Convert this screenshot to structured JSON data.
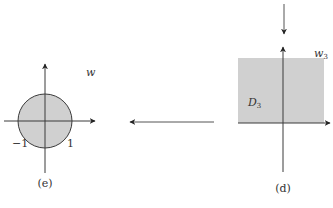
{
  "panels": {
    "e": {
      "caption": "(e)",
      "plane_label": "w",
      "tick_neg": "−1",
      "tick_pos": "1",
      "region": "unit disk"
    },
    "d": {
      "caption": "(d)",
      "plane_label_base": "w",
      "plane_label_sub": "3",
      "region_label_base": "D",
      "region_label_sub": "3",
      "region": "upper half-plane"
    }
  },
  "mapping_arrow": {
    "direction": "left",
    "from": "d",
    "to": "e"
  },
  "colors": {
    "fill": "#d0d0d0",
    "stroke": "#3a3a3a",
    "text": "#333333"
  }
}
